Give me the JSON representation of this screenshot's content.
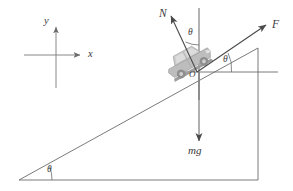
{
  "figure": {
    "labels": {
      "normal_force": "N",
      "applied_force": "F",
      "weight": "mg",
      "axis_y": "y",
      "axis_x": "x",
      "origin": "O",
      "angle_incline": "θ",
      "angle_normal": "θ",
      "angle_force": "θ"
    },
    "colors": {
      "line": "#6b6b6b",
      "vector": "#4a4a4a",
      "text": "#3a3a3a",
      "car_body": "#b9b9b9",
      "car_dark": "#8e8e8e",
      "car_light": "#d5d5d5",
      "background": "#ffffff"
    },
    "geometry": {
      "incline_apex": [
        19,
        180
      ],
      "incline_top": [
        258,
        48
      ],
      "baseline_right": [
        258,
        180
      ],
      "horizontal_reference_y": 72,
      "vertical_through_origin_x": 199,
      "origin_point": [
        197,
        72
      ],
      "axes_origin": [
        56,
        55
      ],
      "axes_y_tip": [
        56,
        25
      ],
      "axes_x_tip": [
        84,
        55
      ],
      "normal_tip": [
        170,
        14
      ],
      "force_tip": [
        268,
        24
      ],
      "weight_tip": [
        197,
        143
      ]
    }
  }
}
